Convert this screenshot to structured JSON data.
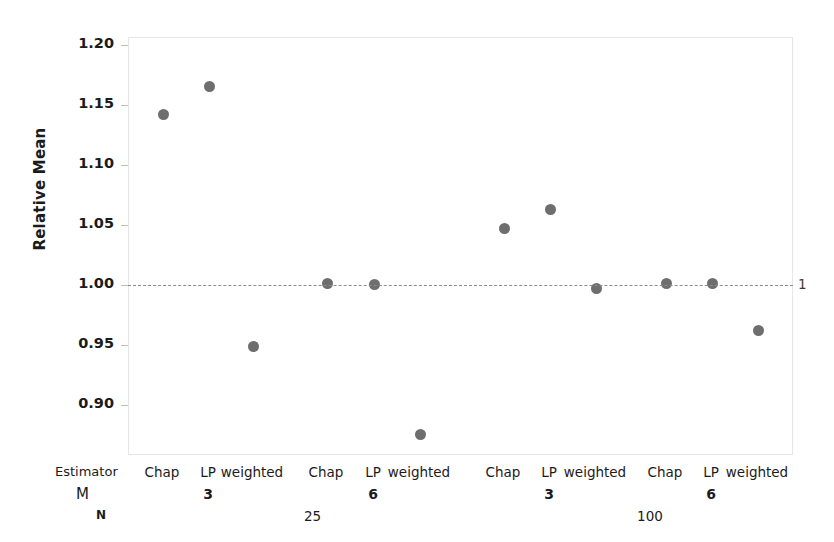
{
  "chart_data": {
    "type": "scatter",
    "title": "",
    "xlabel": "",
    "ylabel": "Relative Mean",
    "ylim": [
      0.865,
      1.215
    ],
    "yticks": [
      1.2,
      1.15,
      1.1,
      1.05,
      1.0,
      0.95,
      0.9
    ],
    "ytick_labels": [
      "1.20",
      "1.15",
      "1.10",
      "1.05",
      "1.00",
      "0.95",
      "0.90"
    ],
    "grid": false,
    "legend": null,
    "reference_line": {
      "value": 1.0,
      "label": "1",
      "style": "dashed",
      "color": "#8c8c8c"
    },
    "point_color": "#6e6e6e",
    "axis_group_rows": [
      "Estimator",
      "M",
      "N"
    ],
    "categories": [
      {
        "estimator": "Chap",
        "M": "3",
        "N": "25"
      },
      {
        "estimator": "LP",
        "M": "3",
        "N": "25"
      },
      {
        "estimator": "weighted",
        "M": "3",
        "N": "25"
      },
      {
        "estimator": "Chap",
        "M": "6",
        "N": "25"
      },
      {
        "estimator": "LP",
        "M": "6",
        "N": "25"
      },
      {
        "estimator": "weighted",
        "M": "6",
        "N": "25"
      },
      {
        "estimator": "Chap",
        "M": "3",
        "N": "100"
      },
      {
        "estimator": "LP",
        "M": "3",
        "N": "100"
      },
      {
        "estimator": "weighted",
        "M": "3",
        "N": "100"
      },
      {
        "estimator": "Chap",
        "M": "6",
        "N": "100"
      },
      {
        "estimator": "LP",
        "M": "6",
        "N": "100"
      },
      {
        "estimator": "weighted",
        "M": "6",
        "N": "100"
      }
    ],
    "values": [
      1.143,
      1.166,
      0.95,
      1.002,
      1.001,
      0.876,
      1.048,
      1.064,
      0.998,
      1.002,
      1.002,
      0.963
    ]
  },
  "axis": {
    "row_labels": {
      "estimator": "Estimator",
      "m": "M",
      "n": "N"
    },
    "n_groups": [
      {
        "label": "25"
      },
      {
        "label": "100"
      }
    ],
    "m_groups": [
      {
        "label": "3"
      },
      {
        "label": "6"
      },
      {
        "label": "3"
      },
      {
        "label": "6"
      }
    ]
  }
}
